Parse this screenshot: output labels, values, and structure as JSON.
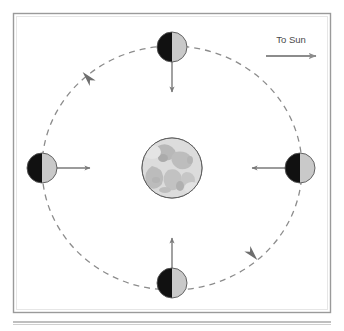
{
  "figure": {
    "frame": {
      "border_color": "#9a9a9a",
      "background": "#ffffff",
      "x": 13,
      "y": 13,
      "width": 318,
      "height": 300
    },
    "rule": {
      "color": "#808080",
      "y": 322
    }
  },
  "sun_indicator": {
    "label": "To Sun",
    "arrow_direction": "right",
    "arrow_color": "#8c8c8c",
    "label_color": "#4a4a4a",
    "label_x": 291,
    "label_y": 42,
    "arrow_x1": 265,
    "arrow_x2": 317,
    "arrow_y": 56
  },
  "central_body": {
    "name": "earth",
    "cx": 172,
    "cy": 168,
    "r": 30,
    "fill": "#d4d4d4",
    "stroke": "#666666",
    "texture_color": "#b3b3b3"
  },
  "orbit": {
    "name": "moon-orbit-path",
    "cx": 172,
    "cy": 168,
    "rx": 130,
    "ry": 122,
    "stroke": "#8c8c8c",
    "dash": "6 5",
    "direction": "counterclockwise",
    "direction_arrows": [
      {
        "name": "orbit-arrow-upper-left",
        "x": 88,
        "y": 78,
        "rotation": 228
      },
      {
        "name": "orbit-arrow-lower-right",
        "x": 252,
        "y": 254,
        "rotation": 48
      }
    ]
  },
  "moons": [
    {
      "name": "moon-top",
      "position_label": "top",
      "cx": 172,
      "cy": 47,
      "r": 15,
      "dark_side": "left",
      "lit_side": "right",
      "dark_fill": "#111111",
      "lit_fill": "#c9c9c9",
      "stroke": "#555555",
      "arrow_direction": "down",
      "arrow_color": "#7a7a7a",
      "arrow_length": 33
    },
    {
      "name": "moon-left",
      "position_label": "left",
      "cx": 42,
      "cy": 168,
      "r": 15,
      "dark_side": "left",
      "lit_side": "right",
      "dark_fill": "#111111",
      "lit_fill": "#c9c9c9",
      "stroke": "#555555",
      "arrow_direction": "right",
      "arrow_color": "#7a7a7a",
      "arrow_length": 33
    },
    {
      "name": "moon-right",
      "position_label": "right",
      "cx": 300,
      "cy": 168,
      "r": 15,
      "dark_side": "left",
      "lit_side": "right",
      "dark_fill": "#111111",
      "lit_fill": "#c9c9c9",
      "stroke": "#555555",
      "arrow_direction": "left",
      "arrow_color": "#7a7a7a",
      "arrow_length": 33
    },
    {
      "name": "moon-bottom",
      "position_label": "bottom",
      "cx": 172,
      "cy": 283,
      "r": 15,
      "dark_side": "left",
      "lit_side": "right",
      "dark_fill": "#111111",
      "lit_fill": "#c9c9c9",
      "stroke": "#555555",
      "arrow_direction": "up",
      "arrow_color": "#7a7a7a",
      "arrow_length": 33
    }
  ]
}
